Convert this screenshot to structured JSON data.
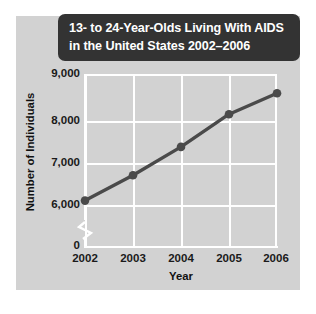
{
  "figure": {
    "panel_color": "#d2d2d2",
    "title_bar_color": "#333333",
    "background_color": "#ffffff"
  },
  "title": {
    "line1": "13- to 24-Year-Olds Living With AIDS",
    "line2": "in the United States 2002–2006"
  },
  "axes": {
    "ylabel": "Number of Individuals",
    "xlabel": "Year",
    "y_ticks": [
      "9,000",
      "8,000",
      "7,000",
      "6,000",
      "0"
    ],
    "x_ticks": [
      "2002",
      "2003",
      "2004",
      "2005",
      "2006"
    ],
    "axis_break": true
  },
  "chart_data": {
    "type": "line",
    "title": "13- to 24-Year-Olds Living With AIDS in the United States 2002–2006",
    "xlabel": "Year",
    "ylabel": "Number of Individuals",
    "categories": [
      "2002",
      "2003",
      "2004",
      "2005",
      "2006"
    ],
    "x": [
      2002,
      2003,
      2004,
      2005,
      2006
    ],
    "values": [
      6100,
      6680,
      7330,
      8080,
      8560
    ],
    "ylim": [
      5500,
      9000
    ],
    "yticks": [
      6000,
      7000,
      8000,
      9000
    ],
    "ytick_labels": [
      "6,000",
      "7,000",
      "8,000",
      "9,000"
    ],
    "zero_tick_label": "0",
    "y_axis_broken": true,
    "grid": true,
    "grid_color": "#ffffff",
    "legend": false,
    "series": [
      {
        "name": "13- to 24-Year-Olds Living With AIDS",
        "color": "#4a4a4a",
        "marker": "circle",
        "values": [
          6100,
          6680,
          7330,
          8080,
          8560
        ]
      }
    ]
  }
}
